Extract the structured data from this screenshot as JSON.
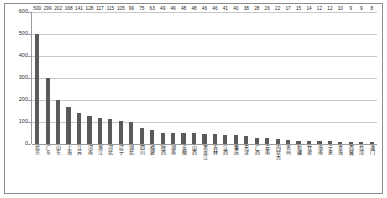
{
  "chart_data": {
    "type": "bar",
    "title": "",
    "subtitle": "",
    "xlabel": "",
    "ylabel": "",
    "ylim": [
      0,
      600
    ],
    "ytick_labels": [
      "600",
      "500",
      "400",
      "300",
      "200",
      "100",
      "0"
    ],
    "ytick_values": [
      600,
      500,
      400,
      300,
      200,
      100,
      0
    ],
    "grid": true,
    "legend": false,
    "legend_position": "none",
    "bar_color": "#5a5a5a",
    "gridline_color": "#c8c8c8",
    "axis_color": "#9a9a9a",
    "border_color": "#8d8d8d",
    "categories": [
      "北京",
      "广东",
      "山东",
      "上海",
      "江苏",
      "河南",
      "浙江",
      "河北",
      "辽宁",
      "湖北",
      "四川",
      "福建",
      "陕西",
      "湖南",
      "安徽",
      "山西",
      "黑龙江",
      "吉林",
      "江西",
      "重庆",
      "天津",
      "广西",
      "云南",
      "内蒙古",
      "贵州",
      "新疆",
      "甘肃",
      "海南",
      "宁夏",
      "青海",
      "西藏",
      "台湾",
      "澳门"
    ],
    "values": [
      500,
      299,
      202,
      168,
      141,
      128,
      117,
      115,
      105,
      99,
      75,
      63,
      49,
      49,
      48,
      48,
      46,
      46,
      41,
      40,
      38,
      28,
      26,
      22,
      17,
      15,
      14,
      12,
      12,
      10,
      9,
      9,
      8
    ]
  }
}
